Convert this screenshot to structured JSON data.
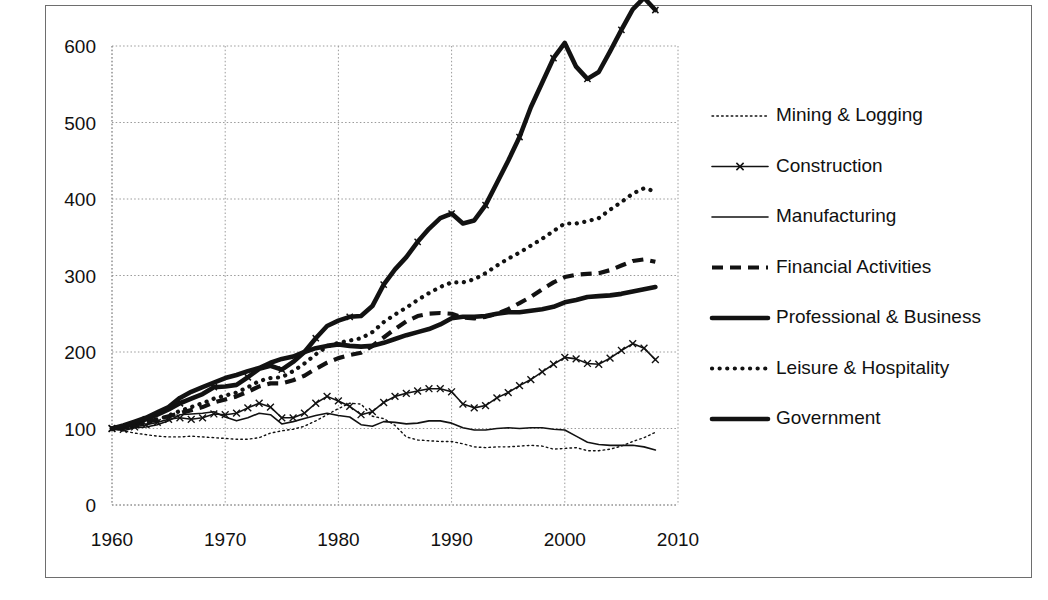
{
  "chart_data": {
    "type": "line",
    "title": "",
    "subtitle": "",
    "xlabel": "",
    "ylabel": "",
    "xlim": [
      1960,
      2010
    ],
    "ylim": [
      0,
      600
    ],
    "xticks": [
      1960,
      1970,
      1980,
      1990,
      2000,
      2010
    ],
    "yticks": [
      0,
      100,
      200,
      300,
      400,
      500,
      600
    ],
    "grid": true,
    "legend_position": "right",
    "note": "Index, 1960 = 100. Employment by industry sector.",
    "x": [
      1960,
      1961,
      1962,
      1963,
      1964,
      1965,
      1966,
      1967,
      1968,
      1969,
      1970,
      1971,
      1972,
      1973,
      1974,
      1975,
      1976,
      1977,
      1978,
      1979,
      1980,
      1981,
      1982,
      1983,
      1984,
      1985,
      1986,
      1987,
      1988,
      1989,
      1990,
      1991,
      1992,
      1993,
      1994,
      1995,
      1996,
      1997,
      1998,
      1999,
      2000,
      2001,
      2002,
      2003,
      2004,
      2005,
      2006,
      2007,
      2008
    ],
    "series": [
      {
        "name": "Mining & Logging",
        "style": "fine-dotted",
        "width": 1.4,
        "values": [
          100,
          97,
          94,
          92,
          90,
          89,
          89,
          90,
          89,
          88,
          87,
          86,
          86,
          88,
          94,
          97,
          99,
          103,
          110,
          118,
          126,
          133,
          132,
          116,
          113,
          104,
          89,
          85,
          84,
          83,
          83,
          80,
          76,
          75,
          76,
          76,
          77,
          78,
          77,
          73,
          74,
          75,
          71,
          71,
          73,
          77,
          83,
          88,
          95
        ]
      },
      {
        "name": "Construction",
        "style": "line-marker",
        "width": 1.6,
        "values": [
          100,
          99,
          102,
          105,
          108,
          112,
          114,
          112,
          114,
          119,
          118,
          120,
          127,
          133,
          128,
          114,
          114,
          120,
          133,
          142,
          136,
          129,
          118,
          122,
          134,
          142,
          146,
          149,
          152,
          152,
          148,
          132,
          127,
          130,
          140,
          147,
          156,
          164,
          174,
          184,
          193,
          191,
          185,
          184,
          192,
          202,
          211,
          205,
          190
        ]
      },
      {
        "name": "Manufacturing",
        "style": "thin-solid",
        "width": 1.6,
        "values": [
          100,
          97,
          101,
          102,
          105,
          110,
          118,
          119,
          120,
          122,
          115,
          110,
          114,
          120,
          118,
          106,
          109,
          113,
          117,
          120,
          117,
          115,
          105,
          103,
          109,
          108,
          106,
          107,
          110,
          110,
          107,
          101,
          98,
          98,
          100,
          101,
          100,
          101,
          101,
          99,
          98,
          90,
          82,
          79,
          78,
          78,
          78,
          76,
          72
        ]
      },
      {
        "name": "Financial Activities",
        "style": "dashed",
        "width": 4.2,
        "values": [
          100,
          102,
          105,
          108,
          112,
          116,
          120,
          124,
          128,
          134,
          138,
          142,
          148,
          155,
          159,
          159,
          163,
          169,
          178,
          186,
          192,
          196,
          199,
          208,
          219,
          230,
          240,
          247,
          250,
          251,
          250,
          245,
          244,
          246,
          250,
          256,
          264,
          272,
          282,
          291,
          298,
          301,
          302,
          303,
          307,
          313,
          319,
          321,
          318
        ]
      },
      {
        "name": "Professional & Business",
        "style": "thick-marker",
        "width": 4.6,
        "values": [
          100,
          102,
          107,
          112,
          118,
          125,
          133,
          139,
          145,
          154,
          155,
          157,
          167,
          178,
          182,
          177,
          187,
          200,
          218,
          234,
          241,
          246,
          247,
          260,
          288,
          308,
          324,
          344,
          361,
          375,
          381,
          368,
          372,
          392,
          421,
          450,
          481,
          520,
          552,
          584,
          604,
          573,
          557,
          566,
          593,
          621,
          648,
          663,
          647
        ]
      },
      {
        "name": "Leisure & Hospitality",
        "style": "dotted",
        "width": 4.2,
        "values": [
          100,
          101,
          104,
          107,
          111,
          117,
          123,
          128,
          133,
          139,
          143,
          147,
          154,
          162,
          166,
          167,
          175,
          185,
          197,
          207,
          212,
          215,
          218,
          226,
          239,
          249,
          258,
          268,
          277,
          285,
          291,
          291,
          295,
          303,
          313,
          322,
          330,
          339,
          348,
          358,
          368,
          368,
          371,
          375,
          386,
          396,
          407,
          414,
          410
        ]
      },
      {
        "name": "Government",
        "style": "thick-solid",
        "width": 4.6,
        "values": [
          100,
          104,
          109,
          114,
          121,
          128,
          140,
          148,
          154,
          160,
          166,
          170,
          175,
          179,
          186,
          191,
          194,
          200,
          205,
          208,
          210,
          208,
          207,
          208,
          212,
          217,
          222,
          226,
          230,
          236,
          244,
          246,
          246,
          247,
          250,
          252,
          252,
          254,
          256,
          259,
          265,
          268,
          272,
          273,
          274,
          276,
          279,
          282,
          285
        ]
      }
    ]
  },
  "legend": {
    "items": [
      {
        "label": "Mining & Logging",
        "style": "fine-dotted"
      },
      {
        "label": "Construction",
        "style": "line-marker"
      },
      {
        "label": "Manufacturing",
        "style": "thin-solid"
      },
      {
        "label": "Financial Activities",
        "style": "dashed"
      },
      {
        "label": "Professional & Business",
        "style": "thick-marker"
      },
      {
        "label": "Leisure & Hospitality",
        "style": "dotted"
      },
      {
        "label": "Government",
        "style": "thick-solid"
      }
    ]
  },
  "colors": {
    "ink": "#121212",
    "grid": "#9a9a9a",
    "border": "#6e6e6e",
    "background": "#ffffff"
  }
}
